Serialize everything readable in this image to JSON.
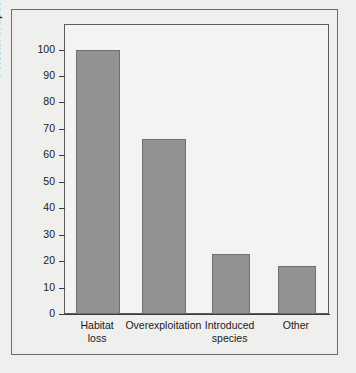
{
  "chart_data": {
    "type": "bar",
    "title": "",
    "subtitle": "",
    "xlabel": "",
    "ylabel": "Percent of species affected",
    "categories": [
      "Habitat loss",
      "Overexploitation",
      "Introduced species",
      "Other"
    ],
    "category_lines": [
      [
        "Habitat",
        "loss"
      ],
      [
        "Overexploitation"
      ],
      [
        "Introduced",
        "species"
      ],
      [
        "Other"
      ]
    ],
    "values": [
      100,
      66,
      22.5,
      18
    ],
    "ylim": [
      0,
      107
    ],
    "yticks": [
      0,
      10,
      20,
      30,
      40,
      50,
      60,
      70,
      80,
      90,
      100
    ],
    "ytick_labels": [
      "0",
      "10",
      "20",
      "30",
      "40",
      "50",
      "60",
      "70",
      "80",
      "90",
      "100"
    ],
    "grid": false,
    "legend": null,
    "bar_color": "#929292",
    "bar_edge_color": "#6f6f6f",
    "axis_color": "#3b3b3b",
    "plot_background": "#f3f3f1",
    "figure_background": "#efefed"
  }
}
